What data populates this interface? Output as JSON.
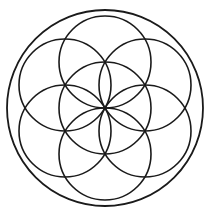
{
  "canvas": {
    "width": 210,
    "height": 216,
    "background_color": "#ffffff",
    "alt_text": "Seed of Life sacred geometry symbol"
  },
  "figure": {
    "name": "seed-of-life",
    "title": "Seed of Life",
    "stroke_color": "#1a1a1a",
    "stroke_width": 1.6,
    "outer_stroke_width": 1.8,
    "fill": "none",
    "center": {
      "x": 105,
      "y": 108
    },
    "petal_radius": 46,
    "outer_radius": 98,
    "petal_count": 6,
    "petal_angles_deg": [
      270,
      330,
      30,
      90,
      150,
      210
    ]
  },
  "chart_data": {
    "type": "scatter",
    "title": "Seed of Life",
    "xlabel": "",
    "ylabel": "",
    "xlim": [
      0,
      210
    ],
    "ylim": [
      0,
      216
    ],
    "grid": false,
    "legend": "none",
    "series": [
      {
        "name": "outer-enclosing-circle",
        "shape": "circle",
        "cx": 105,
        "cy": 108,
        "r": 98
      },
      {
        "name": "center-circle",
        "shape": "circle",
        "cx": 105,
        "cy": 108,
        "r": 46
      },
      {
        "name": "petal-circle-top",
        "shape": "circle",
        "cx": 105,
        "cy": 62,
        "r": 46
      },
      {
        "name": "petal-circle-upper-right",
        "shape": "circle",
        "cx": 145,
        "cy": 85,
        "r": 46
      },
      {
        "name": "petal-circle-lower-right",
        "shape": "circle",
        "cx": 145,
        "cy": 131,
        "r": 46
      },
      {
        "name": "petal-circle-bottom",
        "shape": "circle",
        "cx": 105,
        "cy": 154,
        "r": 46
      },
      {
        "name": "petal-circle-lower-left",
        "shape": "circle",
        "cx": 65,
        "cy": 131,
        "r": 46
      },
      {
        "name": "petal-circle-upper-left",
        "shape": "circle",
        "cx": 65,
        "cy": 85,
        "r": 46
      }
    ]
  }
}
